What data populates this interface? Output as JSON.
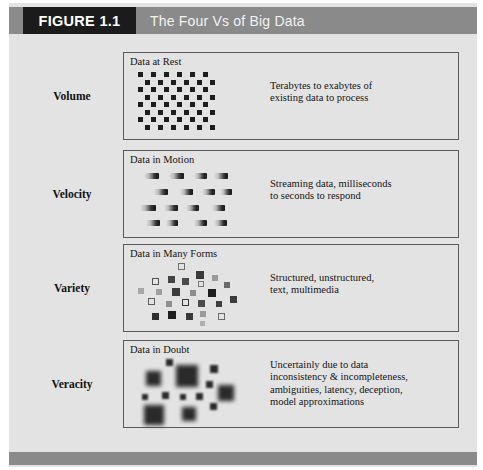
{
  "figure": {
    "tag": "FIGURE 1.1",
    "title": "The Four Vs of Big Data"
  },
  "colors": {
    "header_bar": "#8a8a8a",
    "header_tag_bg": "#1b1b1b",
    "header_tag_text": "#ffffff",
    "header_title_text": "#f2f2f2",
    "plate_bg": "#e3e3e3",
    "box_border": "#5a5a5a",
    "glyph_dark": "#1d1d1d",
    "glyph_mid": "#8f8f8f",
    "glyph_light": "#bdbdbd"
  },
  "rows": [
    {
      "label": "Volume",
      "box_title": "Data at Rest",
      "description": "Terabytes to exabytes of\nexisting data to process",
      "glyph": "grid-of-squares"
    },
    {
      "label": "Velocity",
      "box_title": "Data in Motion",
      "description": "Streaming data, milliseconds\nto seconds to respond",
      "glyph": "motion-blur-dashes"
    },
    {
      "label": "Variety",
      "box_title": "Data in Many Forms",
      "description": "Structured, unstructured,\ntext, multimedia",
      "glyph": "scattered-mixed-squares"
    },
    {
      "label": "Veracity",
      "box_title": "Data in Doubt",
      "description": "Uncertainly due to data\ninconsistency & incompleteness,\nambiguities, latency, deception,\nmodel approximations",
      "glyph": "blurred-squares"
    }
  ],
  "glyph_data": {
    "volume_grid": {
      "cols": 6,
      "rows": 8,
      "cell_w": 13,
      "cell_h": 7.5,
      "dot_size": 5,
      "stagger_offset": 6.5,
      "origin_x": 6,
      "origin_y": 3
    },
    "velocity_dashes": [
      {
        "x": 12,
        "y": 6,
        "w": 15
      },
      {
        "x": 37,
        "y": 6,
        "w": 15
      },
      {
        "x": 62,
        "y": 6,
        "w": 13
      },
      {
        "x": 82,
        "y": 6,
        "w": 14
      },
      {
        "x": 22,
        "y": 22,
        "w": 14
      },
      {
        "x": 48,
        "y": 22,
        "w": 13
      },
      {
        "x": 70,
        "y": 22,
        "w": 13
      },
      {
        "x": 88,
        "y": 22,
        "w": 12
      },
      {
        "x": 8,
        "y": 38,
        "w": 16
      },
      {
        "x": 32,
        "y": 38,
        "w": 14
      },
      {
        "x": 54,
        "y": 38,
        "w": 13
      },
      {
        "x": 80,
        "y": 38,
        "w": 13
      },
      {
        "x": 14,
        "y": 53,
        "w": 14
      },
      {
        "x": 34,
        "y": 53,
        "w": 12
      },
      {
        "x": 62,
        "y": 53,
        "w": 13
      },
      {
        "x": 82,
        "y": 53,
        "w": 13
      }
    ],
    "variety_squares": [
      {
        "x": 46,
        "y": 2,
        "s": 7,
        "style": "outline",
        "shade": "#6e6e6e"
      },
      {
        "x": 64,
        "y": 10,
        "s": 8,
        "style": "fill",
        "shade": "#3a3a3a"
      },
      {
        "x": 36,
        "y": 15,
        "s": 7,
        "style": "fill",
        "shade": "#444444"
      },
      {
        "x": 20,
        "y": 17,
        "s": 7,
        "style": "outline",
        "shade": "#555555"
      },
      {
        "x": 50,
        "y": 17,
        "s": 7,
        "style": "fill",
        "shade": "#4a4a4a"
      },
      {
        "x": 80,
        "y": 14,
        "s": 6,
        "style": "fill",
        "shade": "#9a9a9a"
      },
      {
        "x": 66,
        "y": 20,
        "s": 6,
        "style": "outline",
        "shade": "#777777"
      },
      {
        "x": 92,
        "y": 21,
        "s": 6,
        "style": "fill",
        "shade": "#6a6a6a"
      },
      {
        "x": 6,
        "y": 27,
        "s": 6,
        "style": "fill",
        "shade": "#a8a8a8"
      },
      {
        "x": 24,
        "y": 28,
        "s": 6,
        "style": "fill",
        "shade": "#9e9e9e"
      },
      {
        "x": 40,
        "y": 27,
        "s": 8,
        "style": "fill",
        "shade": "#3c3c3c"
      },
      {
        "x": 58,
        "y": 29,
        "s": 6,
        "style": "fill",
        "shade": "#8c8c8c"
      },
      {
        "x": 76,
        "y": 28,
        "s": 8,
        "style": "fill",
        "shade": "#1f1f1f"
      },
      {
        "x": 16,
        "y": 37,
        "s": 7,
        "style": "outline",
        "shade": "#5d5d5d"
      },
      {
        "x": 34,
        "y": 40,
        "s": 6,
        "style": "fill",
        "shade": "#8f8f8f"
      },
      {
        "x": 50,
        "y": 38,
        "s": 7,
        "style": "outline",
        "shade": "#3a3a3a"
      },
      {
        "x": 66,
        "y": 39,
        "s": 7,
        "style": "fill",
        "shade": "#4c4c4c"
      },
      {
        "x": 84,
        "y": 40,
        "s": 6,
        "style": "fill",
        "shade": "#3f3f3f"
      },
      {
        "x": 98,
        "y": 35,
        "s": 7,
        "style": "fill",
        "shade": "#3b3b3b"
      },
      {
        "x": 20,
        "y": 52,
        "s": 7,
        "style": "fill",
        "shade": "#2e2e2e"
      },
      {
        "x": 36,
        "y": 50,
        "s": 8,
        "style": "fill",
        "shade": "#1e1e1e"
      },
      {
        "x": 54,
        "y": 52,
        "s": 7,
        "style": "fill",
        "shade": "#3a3a3a"
      },
      {
        "x": 68,
        "y": 50,
        "s": 6,
        "style": "fill",
        "shade": "#9b9b9b"
      },
      {
        "x": 86,
        "y": 52,
        "s": 7,
        "style": "outline",
        "shade": "#6a6a6a"
      },
      {
        "x": 68,
        "y": 60,
        "s": 5,
        "style": "fill",
        "shade": "#b0b0b0"
      }
    ],
    "veracity_squares": [
      {
        "x": 34,
        "y": 2,
        "s": 7,
        "blur": "small"
      },
      {
        "x": 14,
        "y": 14,
        "s": 15,
        "blur": "large"
      },
      {
        "x": 44,
        "y": 8,
        "s": 22,
        "blur": "large"
      },
      {
        "x": 78,
        "y": 8,
        "s": 8,
        "blur": "small"
      },
      {
        "x": 74,
        "y": 24,
        "s": 7,
        "blur": "small"
      },
      {
        "x": 86,
        "y": 28,
        "s": 16,
        "blur": "large"
      },
      {
        "x": 10,
        "y": 37,
        "s": 6,
        "blur": "small"
      },
      {
        "x": 30,
        "y": 35,
        "s": 7,
        "blur": "small"
      },
      {
        "x": 48,
        "y": 37,
        "s": 6,
        "blur": "small"
      },
      {
        "x": 64,
        "y": 36,
        "s": 7,
        "blur": "small"
      },
      {
        "x": 12,
        "y": 48,
        "s": 20,
        "blur": "large"
      },
      {
        "x": 50,
        "y": 50,
        "s": 14,
        "blur": "large"
      },
      {
        "x": 78,
        "y": 46,
        "s": 7,
        "blur": "small"
      }
    ]
  }
}
